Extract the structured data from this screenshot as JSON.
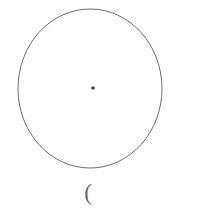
{
  "figure": {
    "background_color": "#ffffff",
    "title": "",
    "shapes": {
      "circle": {
        "name": "circle-outline",
        "type": "ellipse",
        "center_x": 90,
        "center_y": 88.5,
        "radius_x": 72,
        "radius_y": 79.5,
        "stroke_color": "#6e6e73",
        "stroke_width": 1,
        "fill": "none"
      },
      "center_dot": {
        "name": "center-dot",
        "type": "dot",
        "center_x": 93,
        "center_y": 88,
        "radius": 1.8,
        "fill_color": "#4a4a4e"
      }
    },
    "annotation": {
      "text": "(",
      "x": 86,
      "y": 193,
      "color": "#6b6b70"
    }
  }
}
